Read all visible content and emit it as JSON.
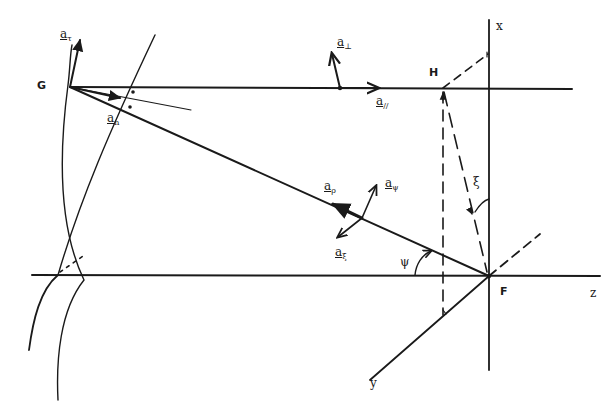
{
  "figure": {
    "ink_color": "#1a1a1a",
    "background": "#ffffff"
  },
  "points": {
    "G": "G",
    "H": "H",
    "F": "F"
  },
  "axes": {
    "x": "x",
    "y": "y",
    "z": "z"
  },
  "vectors": {
    "a_tau": {
      "base": "a",
      "sub": "τ"
    },
    "a_perp": {
      "base": "a",
      "sub": "⊥"
    },
    "a_parallel": {
      "base": "a",
      "sub": "//"
    },
    "a_n": {
      "base": "a",
      "sub": "n"
    },
    "a_rho": {
      "base": "a",
      "sub": "ρ"
    },
    "a_psi": {
      "base": "a",
      "sub": "ψ"
    },
    "a_xi": {
      "base": "a",
      "sub": "ξ"
    }
  },
  "angles": {
    "psi": "ψ",
    "xi": "ξ"
  }
}
